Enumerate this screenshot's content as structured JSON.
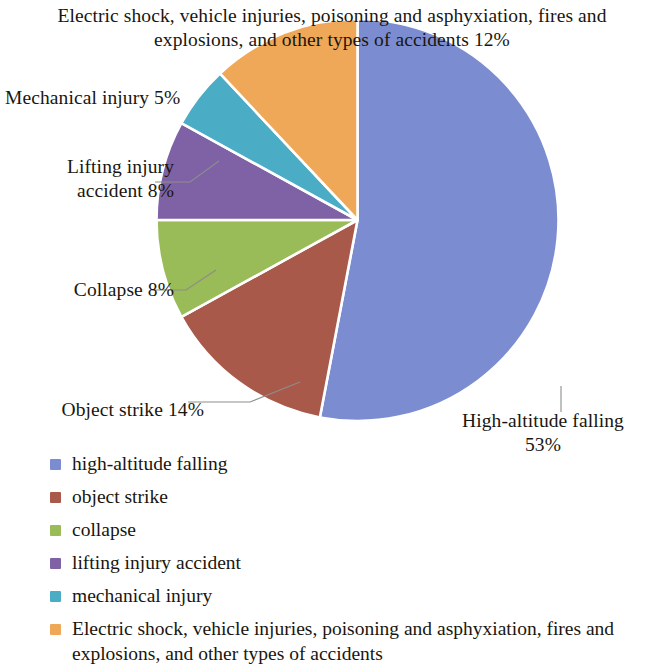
{
  "chart_data": {
    "type": "pie",
    "title": "",
    "categories": [
      "high-altitude falling",
      "object strike",
      "collapse",
      "lifting injury accident",
      "mechanical injury",
      "Electric shock, vehicle injuries, poisoning and asphyxiation, fires and explosions, and other types of accidents"
    ],
    "values": [
      53,
      14,
      8,
      8,
      5,
      12
    ],
    "value_unit": "%",
    "colors": [
      "#7B8DD0",
      "#A9594A",
      "#99BB58",
      "#7E62A5",
      "#4BACC6",
      "#EFA857"
    ],
    "start_angle_deg": 0,
    "direction": "clockwise",
    "legend_position": "bottom",
    "grid": false,
    "data_labels": [
      "High-altitude falling 53%",
      "Object strike 14%",
      "Collapse 8%",
      "Lifting injury accident 8%",
      "Mechanical injury 5%",
      "Electric shock, vehicle injuries, poisoning and asphyxiation, fires and explosions, and other types of accidents 12%"
    ]
  },
  "callouts": {
    "electric": "Electric shock, vehicle injuries, poisoning and asphyxiation, fires and explosions, and other types of accidents 12%",
    "mechanical": "Mechanical injury 5%",
    "lifting": "Lifting injury\naccident 8%",
    "collapse": "Collapse 8%",
    "object": "Object strike 14%",
    "highaltitude": "High-altitude falling\n53%"
  },
  "legend": {
    "items": [
      {
        "label": "high-altitude falling",
        "color": "#7B8DD0"
      },
      {
        "label": "object strike",
        "color": "#A9594A"
      },
      {
        "label": "collapse",
        "color": "#99BB58"
      },
      {
        "label": "lifting injury accident",
        "color": "#7E62A5"
      },
      {
        "label": "mechanical injury",
        "color": "#4BACC6"
      },
      {
        "label": "Electric shock, vehicle injuries, poisoning and asphyxiation, fires and explosions, and other types of accidents",
        "color": "#EFA857"
      }
    ]
  }
}
